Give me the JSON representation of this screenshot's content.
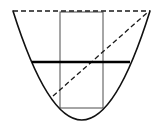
{
  "figure": {
    "type": "geometric-diagram",
    "canvas": {
      "width": 157,
      "height": 131,
      "background": "#ffffff"
    },
    "colors": {
      "stroke": "#1a1a1a",
      "parabola": "#111111",
      "rectangle": "#4d4d4d",
      "chord": "#000000",
      "dashed": "#1a1a1a"
    },
    "shapes": {
      "parabola": {
        "name": "parabola-curve",
        "style": "solid",
        "opens": "up",
        "stroke_width": 1.6,
        "vertex": {
          "x": 82,
          "y": 120
        },
        "left_end": {
          "x": 13,
          "y": 11
        },
        "right_end": {
          "x": 150,
          "y": 11
        },
        "path": "M 13 11 Q 82 229 150 11"
      },
      "rectangle": {
        "name": "inscribed-rectangle",
        "style": "solid",
        "stroke_width": 1.0,
        "x": 60,
        "y": 12,
        "width": 43,
        "height": 96,
        "left": 60,
        "right": 103,
        "top": 12,
        "bottom": 108
      },
      "chord": {
        "name": "horizontal-chord",
        "style": "solid-bold",
        "stroke_width": 2.6,
        "x1": 32,
        "y1": 62,
        "x2": 130,
        "y2": 62
      },
      "dashed_top": {
        "name": "dashed-top-line",
        "style": "dashed",
        "stroke_width": 1.3,
        "dash_pattern": "5,3",
        "x1": 13,
        "y1": 11,
        "x2": 150,
        "y2": 11
      },
      "dashed_diagonal": {
        "name": "dashed-diagonal-line",
        "style": "dashed",
        "stroke_width": 1.3,
        "dash_pattern": "5,3",
        "x1": 53,
        "y1": 96,
        "x2": 148,
        "y2": 12
      }
    }
  }
}
